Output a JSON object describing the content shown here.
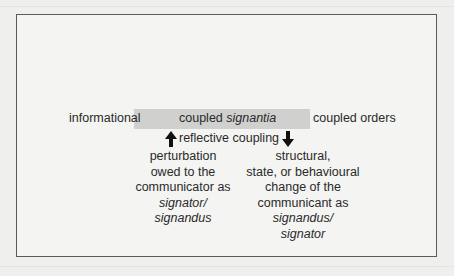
{
  "diagram": {
    "center": {
      "prefix": "coupled ",
      "italic": "signantia"
    },
    "left_label": "informational",
    "right_label": "coupled orders",
    "coupling_label": "reflective coupling",
    "arrows": {
      "up": "arrow-up",
      "down": "arrow-down"
    },
    "left_column": {
      "lines": [
        "perturbation",
        "owed to the",
        "communicator as"
      ],
      "italic_lines": [
        "signator/",
        "signandus"
      ]
    },
    "right_column": {
      "lines": [
        "structural,",
        "state, or behavioural",
        "change of the",
        "communicant as"
      ],
      "italic_lines": [
        "signandus/",
        "signator"
      ]
    },
    "colors": {
      "frame_border": "#5a5a5a",
      "bar_fill": "#d0d0cf",
      "text": "#2a2a2a",
      "background": "#efefed"
    }
  }
}
